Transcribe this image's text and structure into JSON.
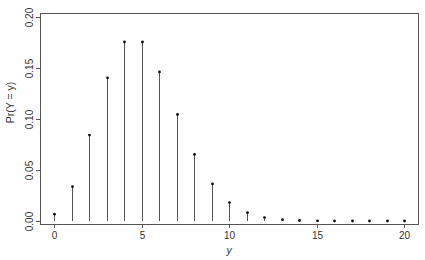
{
  "chart_data": {
    "type": "bar",
    "subtype": "stem",
    "title": "",
    "xlabel": "y",
    "ylabel": "Pr(Y = y)",
    "x": [
      0,
      1,
      2,
      3,
      4,
      5,
      6,
      7,
      8,
      9,
      10,
      11,
      12,
      13,
      14,
      15,
      16,
      17,
      18,
      19,
      20
    ],
    "values": [
      0.0067,
      0.0337,
      0.0842,
      0.1404,
      0.1755,
      0.1755,
      0.1462,
      0.1044,
      0.0653,
      0.0363,
      0.0181,
      0.0082,
      0.0034,
      0.0013,
      0.0005,
      0.0002,
      0.0,
      0.0,
      0.0,
      0.0,
      0.0
    ],
    "xlim": [
      -1,
      21
    ],
    "ylim": [
      0,
      0.2
    ],
    "xticks": [
      0,
      5,
      10,
      15,
      20
    ],
    "xtick_labels": [
      "0",
      "5",
      "10",
      "15",
      "20"
    ],
    "yticks": [
      0,
      0.05,
      0.1,
      0.15,
      0.2
    ],
    "ytick_labels": [
      "0.00",
      "0.05",
      "0.10",
      "0.15",
      "0.20"
    ],
    "grid": false,
    "legend": null,
    "colors": {
      "stem": "#555555",
      "point": "#111111",
      "frame": "#555555",
      "text": "#333333"
    }
  },
  "layout": {
    "plot_left": 40,
    "plot_right": 418,
    "plot_top": 13,
    "plot_bottom": 224,
    "x0_px": 54,
    "x_unit_px": 17.5,
    "y0_px": 221,
    "y_unit_px": 1020
  }
}
